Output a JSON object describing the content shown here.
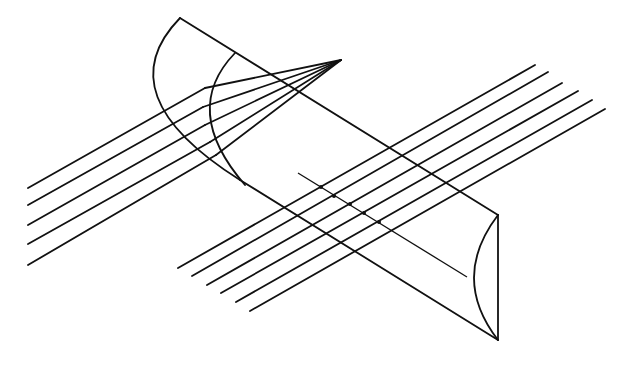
{
  "diagram": {
    "title": "",
    "colors": {
      "stroke": "#111111",
      "background": "#ffffff"
    },
    "cylinder": {
      "back_face": {
        "top": [
          180,
          18
        ],
        "bottom": [
          240,
          180
        ],
        "arc_control": [
          105,
          95
        ]
      },
      "inner_arc": {
        "top": [
          235,
          53
        ],
        "bottom": [
          245,
          185
        ],
        "arc_control": [
          180,
          110
        ]
      },
      "front_face": {
        "top": [
          498,
          215
        ],
        "bottom": [
          498,
          340
        ],
        "arc_control": [
          450,
          278
        ]
      },
      "top_edge": [
        [
          180,
          18
        ],
        [
          498,
          215
        ]
      ],
      "bottom_edge": [
        [
          240,
          180
        ],
        [
          498,
          340
        ]
      ]
    },
    "converging_rays": {
      "focus": [
        341,
        60
      ],
      "rays": [
        {
          "start": [
            28,
            188
          ],
          "refract": [
            205,
            88
          ]
        },
        {
          "start": [
            28,
            205
          ],
          "refract": [
            203,
            107
          ]
        },
        {
          "start": [
            28,
            225
          ],
          "refract": [
            205,
            125
          ]
        },
        {
          "start": [
            28,
            244
          ],
          "refract": [
            210,
            142
          ]
        },
        {
          "start": [
            28,
            265
          ],
          "refract": [
            216,
            155
          ]
        }
      ]
    },
    "parallel_rays": [
      {
        "start": [
          178,
          268
        ],
        "end": [
          535,
          65
        ]
      },
      {
        "start": [
          192,
          276
        ],
        "end": [
          548,
          72
        ]
      },
      {
        "start": [
          207,
          285
        ],
        "end": [
          562,
          83
        ]
      },
      {
        "start": [
          221,
          293
        ],
        "end": [
          578,
          91
        ]
      },
      {
        "start": [
          236,
          302
        ],
        "end": [
          592,
          100
        ]
      },
      {
        "start": [
          250,
          311
        ],
        "end": [
          605,
          109
        ]
      }
    ],
    "focal_line": {
      "start": [
        298,
        173
      ],
      "end": [
        467,
        277
      ],
      "dots": [
        [
          321,
          187
        ],
        [
          334,
          196
        ],
        [
          350,
          204
        ],
        [
          364,
          213
        ],
        [
          379,
          222
        ]
      ]
    }
  }
}
